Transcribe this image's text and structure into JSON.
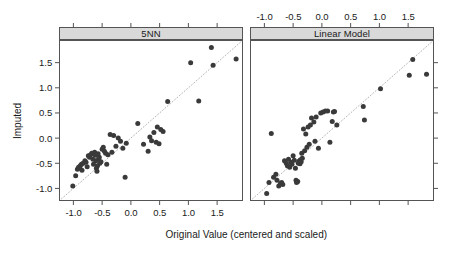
{
  "figure": {
    "width": 456,
    "height": 254,
    "background": "#ffffff",
    "point_color": "#3a3a3a",
    "frame_color": "#545454",
    "strip_background": "#d9d9d9",
    "reference_line_color": "#b4b4b4",
    "reference_line_style": "dotted"
  },
  "axes": {
    "x_title": "Original Value (centered and scaled)",
    "y_title": "Imputed",
    "x_ticks": [
      "-1.0",
      "-0.5",
      "0.0",
      "0.5",
      "1.0",
      "1.5"
    ],
    "x_tick_values": [
      -1.0,
      -0.5,
      0.0,
      0.5,
      1.0,
      1.5
    ],
    "y_ticks": [
      "-1.0",
      "-0.5",
      "0.0",
      "0.5",
      "1.0",
      "1.5"
    ],
    "y_tick_values": [
      -1.0,
      -0.5,
      0.0,
      0.5,
      1.0,
      1.5
    ],
    "xlim": [
      -1.25,
      1.95
    ],
    "ylim": [
      -1.25,
      1.95
    ],
    "top_ticks_labeled_panel": "Linear Model",
    "right_ticks_labeled": false
  },
  "chart_data": {
    "type": "scatter",
    "title": "",
    "xlabel": "Original Value (centered and scaled)",
    "ylabel": "Imputed",
    "xlim": [
      -1.25,
      1.95
    ],
    "ylim": [
      -1.25,
      1.95
    ],
    "grid": false,
    "legend": "none",
    "annotations": [
      "dotted 1:1 identity reference line in each panel"
    ],
    "panels": [
      {
        "label": "5NN",
        "x": [
          -1.01,
          -0.96,
          -0.93,
          -0.91,
          -0.9,
          -0.88,
          -0.86,
          -0.85,
          -0.83,
          -0.8,
          -0.78,
          -0.76,
          -0.74,
          -0.72,
          -0.7,
          -0.68,
          -0.66,
          -0.65,
          -0.63,
          -0.62,
          -0.61,
          -0.6,
          -0.59,
          -0.58,
          -0.57,
          -0.56,
          -0.55,
          -0.54,
          -0.52,
          -0.5,
          -0.48,
          -0.46,
          -0.44,
          -0.42,
          -0.4,
          -0.36,
          -0.33,
          -0.3,
          -0.26,
          -0.22,
          -0.18,
          -0.14,
          -0.1,
          -0.08,
          0.12,
          0.22,
          0.3,
          0.33,
          0.36,
          0.4,
          0.44,
          0.46,
          0.49,
          0.52,
          0.56,
          0.64,
          1.04,
          1.18,
          1.4,
          1.43,
          1.83
        ],
        "y": [
          -0.95,
          -0.75,
          -0.62,
          -0.58,
          -0.6,
          -0.55,
          -0.52,
          -0.64,
          -0.5,
          -0.45,
          -0.48,
          -0.57,
          -0.35,
          -0.38,
          -0.33,
          -0.3,
          -0.42,
          -0.52,
          -0.28,
          -0.34,
          -0.45,
          -0.6,
          -0.66,
          -0.55,
          -0.31,
          -0.41,
          -0.38,
          -0.5,
          -0.47,
          -0.22,
          -0.18,
          -0.26,
          -0.3,
          -0.52,
          -0.33,
          0.07,
          -0.28,
          0.05,
          -0.16,
          0.0,
          -0.06,
          -0.2,
          -0.78,
          -0.1,
          0.29,
          -0.12,
          -0.26,
          0.02,
          -0.05,
          0.11,
          -0.08,
          0.22,
          -0.11,
          0.17,
          0.13,
          0.73,
          1.5,
          0.74,
          1.8,
          1.45,
          1.57
        ]
      },
      {
        "label": "Linear Model",
        "x": [
          -0.96,
          -0.92,
          -0.88,
          -0.84,
          -0.8,
          -0.78,
          -0.75,
          -0.72,
          -0.7,
          -0.68,
          -0.65,
          -0.62,
          -0.6,
          -0.58,
          -0.56,
          -0.54,
          -0.52,
          -0.5,
          -0.48,
          -0.46,
          -0.45,
          -0.44,
          -0.42,
          -0.41,
          -0.4,
          -0.39,
          -0.38,
          -0.37,
          -0.36,
          -0.35,
          -0.34,
          -0.32,
          -0.3,
          -0.28,
          -0.26,
          -0.24,
          -0.22,
          -0.2,
          -0.18,
          -0.14,
          -0.12,
          -0.1,
          -0.06,
          -0.02,
          0.02,
          0.06,
          0.1,
          0.14,
          0.18,
          0.2,
          0.22,
          0.26,
          0.72,
          0.74,
          1.02,
          1.52,
          1.58,
          1.82
        ],
        "y": [
          -1.1,
          -0.88,
          0.09,
          -0.78,
          -0.72,
          -0.84,
          -0.95,
          -0.9,
          -0.88,
          -0.92,
          -0.45,
          -0.5,
          -0.55,
          -0.42,
          -0.58,
          -0.48,
          -0.52,
          -0.35,
          -0.44,
          -0.6,
          -0.84,
          -0.88,
          -0.86,
          -0.5,
          -0.46,
          -0.48,
          -0.51,
          -0.43,
          -0.47,
          -0.3,
          -0.4,
          0.18,
          -0.25,
          0.08,
          -0.18,
          0.22,
          -0.12,
          0.26,
          0.4,
          0.32,
          -0.06,
          0.42,
          -0.2,
          0.5,
          0.52,
          0.54,
          0.54,
          -0.08,
          0.33,
          0.52,
          0.53,
          0.26,
          0.63,
          0.36,
          0.98,
          1.25,
          1.56,
          1.27
        ]
      }
    ]
  }
}
